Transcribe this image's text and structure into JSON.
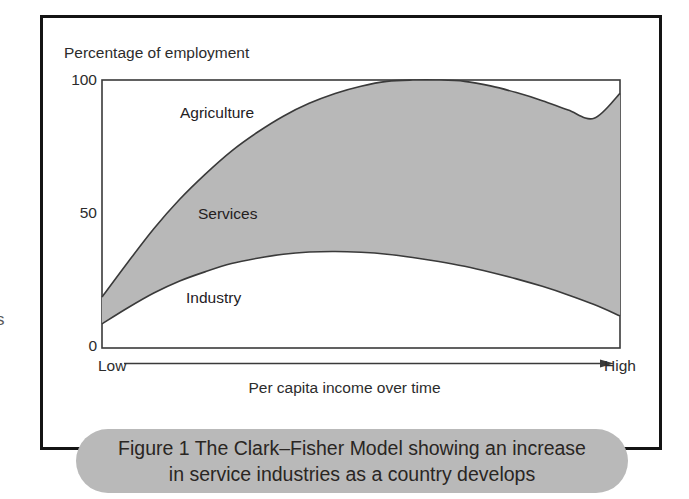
{
  "figure": {
    "caption": "Figure 1 The Clark–Fisher Model showing an increase\nin service industries as a country develops",
    "margin_glyph": "s"
  },
  "colors": {
    "band_fill": "#b8b8b8",
    "curve_stroke": "#3a3a3a",
    "frame": "#141414",
    "axis": "#3a3a3a",
    "caption_pill": "#b9b9b9",
    "text": "#2c2c2c",
    "plot_background": "#ffffff"
  },
  "chart_data": {
    "type": "area",
    "title": "",
    "subtitle": "",
    "xlabel": "Per capita income over time",
    "ylabel": "Percentage of employment",
    "ylim": [
      0,
      100
    ],
    "xlim": [
      0,
      100
    ],
    "grid": false,
    "legend": "inline-annotations",
    "ytick_labels": [
      "0",
      "50",
      "100"
    ],
    "ytick_values": [
      0,
      50,
      100
    ],
    "xtick_labels": [
      "Low",
      "High"
    ],
    "x_axis_arrow": true,
    "x": [
      0,
      5,
      10,
      15,
      20,
      25,
      30,
      35,
      40,
      45,
      50,
      55,
      60,
      65,
      70,
      75,
      80,
      85,
      90,
      95,
      100
    ],
    "series": [
      {
        "name": "Industry",
        "role": "lower-boundary",
        "fill": "#ffffff",
        "annotation": "Industry",
        "values": [
          9,
          15,
          20.5,
          25,
          28.5,
          31.5,
          33.5,
          35,
          35.8,
          36,
          35.7,
          35,
          33.8,
          32.3,
          30.5,
          28.3,
          25.8,
          23,
          19.8,
          16.2,
          12
        ]
      },
      {
        "name": "Services",
        "role": "band",
        "fill": "#b8b8b8",
        "annotation": "Services",
        "values": [
          10,
          17,
          24,
          30.5,
          36.5,
          42,
          47,
          51.5,
          55.5,
          59,
          62,
          64.5,
          66.5,
          68,
          69,
          69.5,
          69.5,
          69.3,
          69,
          69.5,
          83
        ]
      },
      {
        "name": "Agriculture",
        "role": "upper-remainder",
        "fill": "#ffffff",
        "annotation": "Agriculture",
        "values": [
          81,
          68,
          55.5,
          44.5,
          35,
          26.5,
          19.5,
          13.5,
          8.7,
          5,
          2.3,
          0.5,
          -0.3,
          -0.3,
          0.5,
          2.2,
          4.7,
          7.7,
          11.2,
          14.3,
          5
        ]
      }
    ],
    "cumulative_upper_curve": {
      "name": "Industry + Services (top of shaded band)",
      "values": [
        19,
        32,
        44.5,
        55.5,
        65,
        73.5,
        80.5,
        86.5,
        91.3,
        95,
        97.7,
        99.5,
        100.3,
        100.3,
        99.5,
        97.8,
        95.3,
        92.3,
        88.8,
        85.7,
        95
      ]
    },
    "annotations": [
      {
        "text": "Agriculture",
        "region": "upper-white"
      },
      {
        "text": "Services",
        "region": "shaded-band"
      },
      {
        "text": "Industry",
        "region": "lower-white"
      }
    ]
  }
}
